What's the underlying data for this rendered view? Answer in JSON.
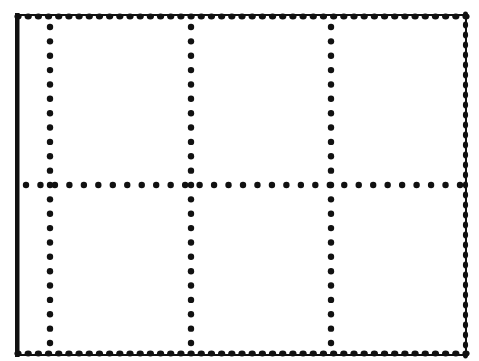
{
  "diagram": {
    "type": "stamp-sheet-perforation-grid",
    "background": "#ffffff",
    "ink": "#111111",
    "frame": {
      "left": 18,
      "top": 15,
      "right": 466,
      "bottom": 355,
      "left_edge_style": "solid",
      "other_edges_style": "scalloped-perforation"
    },
    "grid": {
      "rows": 2,
      "columns": 3,
      "vertical_perforations_x": [
        50,
        191,
        331
      ],
      "horizontal_perforations_y": [
        185
      ],
      "dot_radius": 3.2,
      "dot_spacing": 14.5
    }
  }
}
